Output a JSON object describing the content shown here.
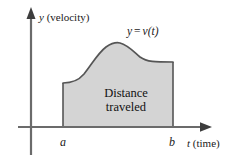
{
  "figure": {
    "name": "velocity-time-distance-traveled-diagram",
    "background_color": "#ffffff",
    "line_color": "#4d4d4d",
    "fill_color": "#d4d4d4",
    "fill_stroke_color": "#555555",
    "text_color": "#1a1a1a"
  },
  "axes": {
    "y": {
      "variable": "y",
      "quantity": "(velocity)",
      "label": "y (velocity)",
      "x_px": 31,
      "top_px": 9,
      "bottom_px": 155,
      "arrow": "up"
    },
    "x": {
      "variable": "t",
      "quantity": "(time)",
      "label": "t (time)",
      "y_px": 127,
      "left_px": 18,
      "right_px": 211,
      "arrow": "right"
    }
  },
  "curve": {
    "label": "y = v(t)",
    "label_parts": {
      "lhs": "y",
      "equals": "=",
      "rhs": "v(t)"
    },
    "path": "M 63 83 C 72 83 78 81 84 74 C 92 64 98 53 106 47 C 112 43 116 42 120 43 C 128 45 134 52 140 57 C 147 62 155 62 173 62"
  },
  "region": {
    "label_line1": "Distance",
    "label_line2": "traveled",
    "label": "Distance traveled",
    "fill_path": "M 63 127 L 63 83 C 72 83 78 81 84 74 C 92 64 98 53 106 47 C 112 43 116 42 120 43 C 128 45 134 52 140 57 C 147 62 155 62 173 62 L 173 127 Z",
    "left_boundary_x": 63,
    "right_boundary_x": 173,
    "baseline_y": 127
  },
  "ticks": [
    {
      "label": "a",
      "x_px": 63,
      "axis": "x"
    },
    {
      "label": "b",
      "x_px": 173,
      "axis": "x"
    }
  ]
}
